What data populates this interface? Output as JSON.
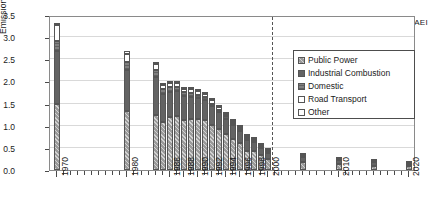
{
  "source_label": "NAEI",
  "band": {
    "historic_label": "historic",
    "projection_label": "projection"
  },
  "legend": {
    "items": [
      {
        "label": "Public Power",
        "swatch": "hatched-grey"
      },
      {
        "label": "Industrial Combustion",
        "swatch": "dark-grey"
      },
      {
        "label": "Domestic",
        "swatch": "mid-grey"
      },
      {
        "label": "Road Transport",
        "swatch": "white"
      },
      {
        "label": "Other",
        "swatch": "white"
      }
    ]
  },
  "chart_data": {
    "type": "bar",
    "title": "",
    "subtitle": "",
    "xlabel": "",
    "ylabel": "Emission (Mt-S)",
    "ylim": [
      0.0,
      3.5
    ],
    "ytick_labels": [
      "0.0",
      "0.5",
      "1.0",
      "1.5",
      "2.0",
      "2.5",
      "3.0",
      "3.5"
    ],
    "ytick_values": [
      0.0,
      0.5,
      1.0,
      1.5,
      2.0,
      2.5,
      3.0,
      3.5
    ],
    "xlim": [
      1969,
      2021
    ],
    "xtick_labels": [
      "1970",
      "1980",
      "1986",
      "1988",
      "1990",
      "1992",
      "1994",
      "1996",
      "1998",
      "2000",
      "2010",
      "2020"
    ],
    "xtick_values": [
      1970,
      1980,
      1986,
      1988,
      1990,
      1992,
      1994,
      1996,
      1998,
      2000,
      2010,
      2020
    ],
    "grid": true,
    "grid_axis": "y",
    "legend_position": "upper-right",
    "stacked": true,
    "annotations": [
      {
        "text": "historic",
        "type": "arrow-band",
        "range": [
          1970,
          2000
        ],
        "direction": "left"
      },
      {
        "text": "projection",
        "type": "arrow-band",
        "range": [
          2000,
          2020
        ],
        "direction": "right"
      },
      {
        "text": "NAEI",
        "type": "corner-label",
        "position": "top-right"
      }
    ],
    "divider": {
      "x": 2000.5,
      "style": "dashed"
    },
    "categories": [
      1970,
      1980,
      1984,
      1985,
      1986,
      1987,
      1988,
      1989,
      1990,
      1991,
      1992,
      1993,
      1994,
      1995,
      1996,
      1997,
      1998,
      1999,
      2000,
      2005,
      2010,
      2015,
      2020
    ],
    "series": [
      {
        "name": "Public Power",
        "values": [
          1.5,
          1.33,
          1.24,
          1.08,
          1.19,
          1.21,
          1.14,
          1.16,
          1.16,
          1.12,
          1.02,
          0.92,
          0.82,
          0.7,
          0.6,
          0.44,
          0.43,
          0.35,
          0.26,
          0.17,
          0.13,
          0.1,
          0.08
        ]
      },
      {
        "name": "Industrial Combustion",
        "values": [
          1.18,
          0.92,
          0.85,
          0.63,
          0.57,
          0.57,
          0.53,
          0.5,
          0.46,
          0.45,
          0.42,
          0.38,
          0.34,
          0.31,
          0.28,
          0.24,
          0.21,
          0.15,
          0.13,
          0.13,
          0.1,
          0.08,
          0.06
        ]
      },
      {
        "name": "Domestic",
        "values": [
          0.24,
          0.19,
          0.16,
          0.12,
          0.11,
          0.1,
          0.09,
          0.08,
          0.08,
          0.07,
          0.06,
          0.06,
          0.05,
          0.05,
          0.04,
          0.04,
          0.03,
          0.03,
          0.03,
          0.02,
          0.02,
          0.01,
          0.01
        ]
      },
      {
        "name": "Road Transport",
        "values": [
          0.35,
          0.19,
          0.14,
          0.1,
          0.09,
          0.09,
          0.08,
          0.08,
          0.08,
          0.07,
          0.07,
          0.06,
          0.06,
          0.05,
          0.05,
          0.04,
          0.04,
          0.03,
          0.03,
          0.01,
          0.01,
          0.01,
          0.01
        ]
      },
      {
        "name": "Other",
        "values": [
          0.03,
          0.05,
          0.04,
          0.03,
          0.04,
          0.04,
          0.04,
          0.04,
          0.04,
          0.04,
          0.04,
          0.04,
          0.04,
          0.04,
          0.04,
          0.04,
          0.04,
          0.04,
          0.04,
          0.02,
          0.02,
          0.02,
          0.02
        ]
      }
    ]
  }
}
